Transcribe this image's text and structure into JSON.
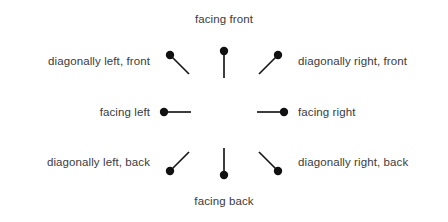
{
  "diagram": {
    "title_top": "facing front",
    "title_bottom": "facing back",
    "dot_color": "#111111",
    "line_color": "#1a1a1a",
    "text_color": "#3b3b3b",
    "background_color": "#ffffff",
    "items": [
      {
        "id": "diagonally-left-front",
        "label": "diagonally left, front",
        "label_side": "left",
        "grid": {
          "row": 0,
          "col": 0
        },
        "glyph": "pin-icon",
        "heading_degrees": 315,
        "dot": {
          "x": 17,
          "y": 17
        },
        "tail": {
          "x": 36,
          "y": 36
        }
      },
      {
        "id": "facing-front",
        "label": "facing front",
        "label_side": "top",
        "grid": {
          "row": 0,
          "col": 1
        },
        "glyph": "pin-icon",
        "heading_degrees": 0,
        "dot": {
          "x": 24,
          "y": 13
        },
        "tail": {
          "x": 24,
          "y": 40
        }
      },
      {
        "id": "diagonally-right-front",
        "label": "diagonally right, front",
        "label_side": "right",
        "grid": {
          "row": 0,
          "col": 2
        },
        "glyph": "pin-icon",
        "heading_degrees": 45,
        "dot": {
          "x": 31,
          "y": 17
        },
        "tail": {
          "x": 12,
          "y": 36
        }
      },
      {
        "id": "facing-left",
        "label": "facing left",
        "label_side": "left",
        "grid": {
          "row": 1,
          "col": 0
        },
        "glyph": "pin-icon",
        "heading_degrees": 270,
        "dot": {
          "x": 11,
          "y": 24
        },
        "tail": {
          "x": 38,
          "y": 24
        }
      },
      {
        "id": "facing-right",
        "label": "facing right",
        "label_side": "right",
        "grid": {
          "row": 1,
          "col": 2
        },
        "glyph": "pin-icon",
        "heading_degrees": 90,
        "dot": {
          "x": 37,
          "y": 24
        },
        "tail": {
          "x": 10,
          "y": 24
        }
      },
      {
        "id": "diagonally-left-back",
        "label": "diagonally left, back",
        "label_side": "left",
        "grid": {
          "row": 2,
          "col": 0
        },
        "glyph": "pin-icon",
        "heading_degrees": 225,
        "dot": {
          "x": 17,
          "y": 33
        },
        "tail": {
          "x": 36,
          "y": 14
        }
      },
      {
        "id": "facing-back",
        "label": "facing back",
        "label_side": "bottom",
        "grid": {
          "row": 2,
          "col": 1
        },
        "glyph": "pin-icon",
        "heading_degrees": 180,
        "dot": {
          "x": 24,
          "y": 37
        },
        "tail": {
          "x": 24,
          "y": 10
        }
      },
      {
        "id": "diagonally-right-back",
        "label": "diagonally right, back",
        "label_side": "right",
        "grid": {
          "row": 2,
          "col": 2
        },
        "glyph": "pin-icon",
        "heading_degrees": 135,
        "dot": {
          "x": 31,
          "y": 33
        },
        "tail": {
          "x": 12,
          "y": 14
        }
      }
    ]
  }
}
